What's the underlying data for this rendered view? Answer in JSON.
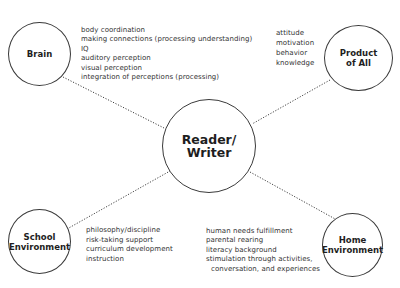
{
  "center": {
    "label": "Reader/\nWriter"
  },
  "nodes": {
    "brain": {
      "label": "Brain",
      "items": [
        "body coordination",
        "making connections (processing understanding)",
        "IQ",
        "auditory perception",
        "visual perception",
        "integration of perceptions (processing)"
      ]
    },
    "product": {
      "label": "Product\nof All",
      "items": [
        "attitude",
        "motivation",
        "behavior",
        "knowledge"
      ]
    },
    "school": {
      "label": "School\nEnvironment",
      "items": [
        "philosophy/discipline",
        "risk-taking support",
        "curriculum development",
        "instruction"
      ]
    },
    "home": {
      "label": "Home\nEnvironment",
      "items": [
        "human needs fulfillment",
        "parental rearing",
        "literacy background",
        "stimulation through activities,",
        "conversation, and experiences"
      ]
    }
  },
  "colors": {
    "stroke": "#3a3a3a",
    "text": "#2a2a2a",
    "background": "#ffffff"
  }
}
